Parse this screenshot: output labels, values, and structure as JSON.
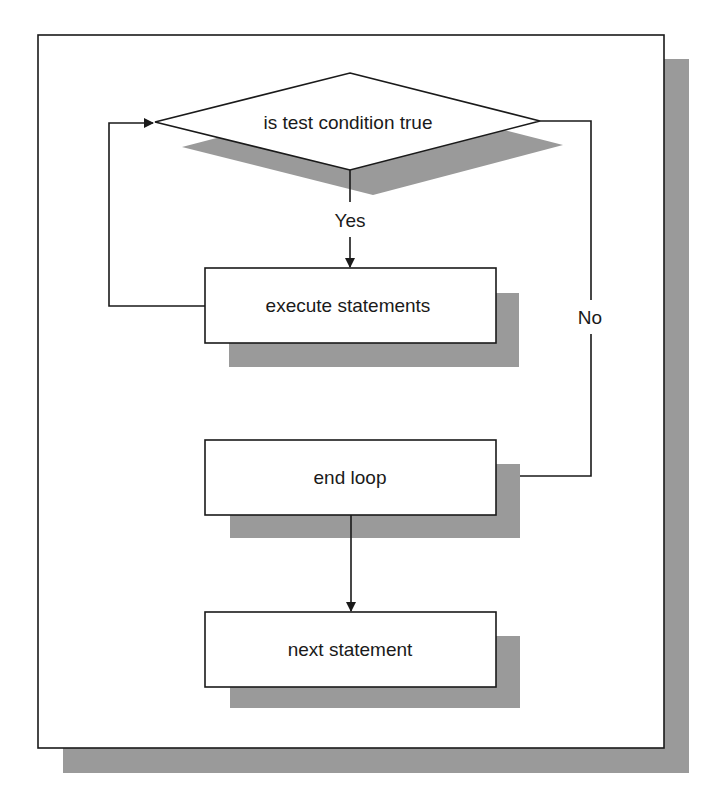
{
  "diagram": {
    "type": "flowchart",
    "colors": {
      "stroke": "#1a1a1a",
      "shadow": "#9a9a9a",
      "fill": "#ffffff"
    },
    "nodes": [
      {
        "id": "decision",
        "shape": "diamond",
        "label": "is test condition true"
      },
      {
        "id": "execute",
        "shape": "rectangle",
        "label": "execute statements"
      },
      {
        "id": "end_loop",
        "shape": "rectangle",
        "label": "end loop"
      },
      {
        "id": "next",
        "shape": "rectangle",
        "label": "next statement"
      }
    ],
    "edges": [
      {
        "from": "decision",
        "to": "execute",
        "label": "Yes"
      },
      {
        "from": "execute",
        "to": "decision",
        "label": ""
      },
      {
        "from": "decision",
        "to": "end_loop",
        "label": "No"
      },
      {
        "from": "end_loop",
        "to": "next",
        "label": ""
      }
    ]
  }
}
